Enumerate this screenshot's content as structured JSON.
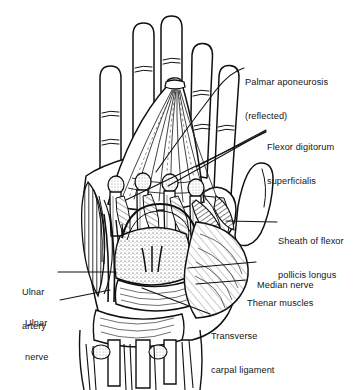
{
  "figure": {
    "background_color": "#ffffff",
    "ink_color": "#111111"
  },
  "labels": [
    {
      "id": "palmar-aponeurosis",
      "line1": "Palmar aponeurosis",
      "line2": "(reflected)",
      "x": 245,
      "y": 55
    },
    {
      "id": "flexor-digitorum-superficialis",
      "line1": "Flexor digitorum",
      "line2": "superficialis",
      "x": 267,
      "y": 120
    },
    {
      "id": "sheath-of-flexor-pollicis-longus",
      "line1": "Sheath of flexor",
      "line2": "pollicis longus",
      "x": 278,
      "y": 214
    },
    {
      "id": "median-nerve",
      "line1": "Median nerve",
      "line2": "",
      "x": 257,
      "y": 258
    },
    {
      "id": "thenar-muscles",
      "line1": "Thenar muscles",
      "line2": "",
      "x": 247,
      "y": 276
    },
    {
      "id": "transverse-carpal-ligament",
      "line1": "Transverse",
      "line2": "carpal ligament",
      "x": 211,
      "y": 309
    },
    {
      "id": "ulnar-artery",
      "line1": "Ulnar",
      "line2": "artery",
      "x": 22,
      "y": 265
    },
    {
      "id": "ulnar-nerve",
      "line1": "Ulnar",
      "line2": "nerve",
      "x": 25,
      "y": 296
    }
  ]
}
